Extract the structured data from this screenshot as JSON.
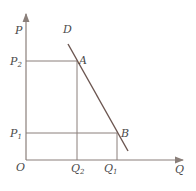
{
  "diagram": {
    "type": "demand-curve",
    "colors": {
      "axis": "#8a7f7a",
      "curve": "#6b5550",
      "guide": "#8a7f7a",
      "text": "#4a4a4a"
    },
    "axes": {
      "y_label": "P",
      "x_label": "Q",
      "origin_label": "O"
    },
    "curve_label": "D",
    "points": [
      {
        "name": "A",
        "price": "P",
        "price_sub": "2",
        "qty": "Q",
        "qty_sub": "2"
      },
      {
        "name": "B",
        "price": "P",
        "price_sub": "1",
        "qty": "Q",
        "qty_sub": "1"
      }
    ]
  }
}
